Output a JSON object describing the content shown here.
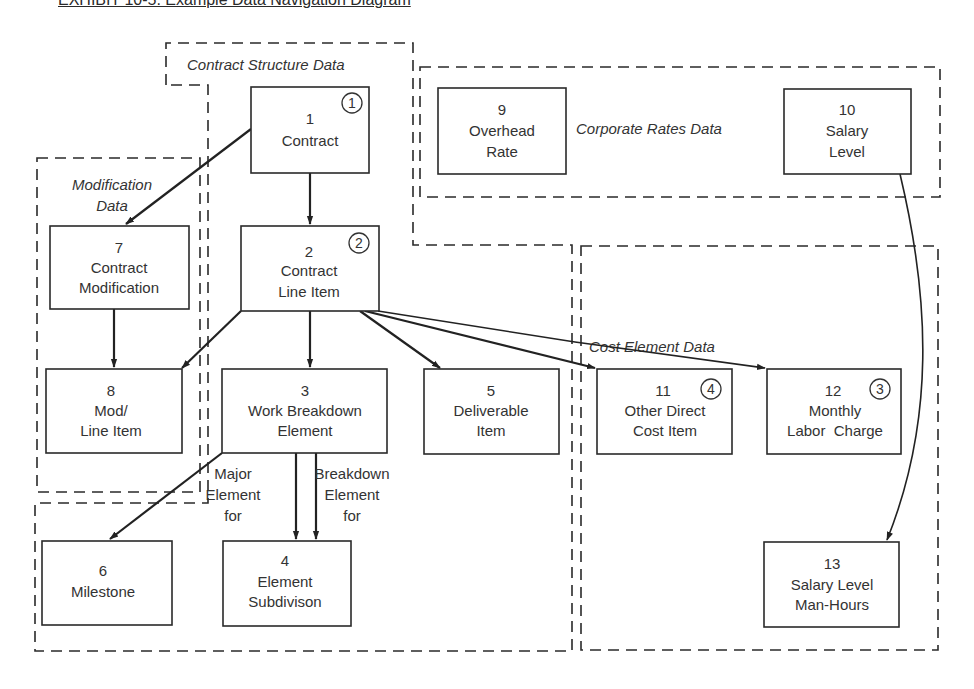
{
  "title": "EXHIBIT 10-5.  Example Data Navigation Diagram",
  "regions": {
    "contract_structure": "Contract Structure Data",
    "corporate_rates": "Corporate Rates Data",
    "modification": [
      "Modification",
      "Data"
    ],
    "cost_element": "Cost Element Data"
  },
  "entities": {
    "e1": {
      "num": "1",
      "lines": [
        "Contract"
      ],
      "step": "1"
    },
    "e2": {
      "num": "2",
      "lines": [
        "Contract",
        "Line Item"
      ],
      "step": "2"
    },
    "e3": {
      "num": "3",
      "lines": [
        "Work Breakdown",
        "Element"
      ]
    },
    "e4": {
      "num": "4",
      "lines": [
        "Element",
        "Subdivison"
      ]
    },
    "e5": {
      "num": "5",
      "lines": [
        "Deliverable",
        "Item"
      ]
    },
    "e6": {
      "num": "6",
      "lines": [
        "Milestone"
      ]
    },
    "e7": {
      "num": "7",
      "lines": [
        "Contract",
        "Modification"
      ]
    },
    "e8": {
      "num": "8",
      "lines": [
        "Mod/",
        "Line Item"
      ]
    },
    "e9": {
      "num": "9",
      "lines": [
        "Overhead",
        "Rate"
      ]
    },
    "e10": {
      "num": "10",
      "lines": [
        "Salary",
        "Level"
      ]
    },
    "e11": {
      "num": "11",
      "lines": [
        "Other Direct",
        "Cost Item"
      ],
      "step": "4"
    },
    "e12": {
      "num": "12",
      "lines": [
        "Monthly",
        "Labor  Charge"
      ],
      "step": "3"
    },
    "e13": {
      "num": "13",
      "lines": [
        "Salary Level",
        "Man-Hours"
      ]
    }
  },
  "relationships": {
    "major": [
      "Major",
      "Element",
      "for"
    ],
    "breakdown": [
      "Breakdown",
      "Element",
      "for"
    ]
  },
  "edges": [
    {
      "from": "1",
      "to": "2"
    },
    {
      "from": "1",
      "to": "7"
    },
    {
      "from": "7",
      "to": "8"
    },
    {
      "from": "2",
      "to": "8"
    },
    {
      "from": "2",
      "to": "3"
    },
    {
      "from": "2",
      "to": "5"
    },
    {
      "from": "2",
      "to": "11"
    },
    {
      "from": "2",
      "to": "12"
    },
    {
      "from": "3",
      "to": "6"
    },
    {
      "from": "3",
      "to": "4",
      "label": "Major Element for"
    },
    {
      "from": "3",
      "to": "4",
      "label": "Breakdown Element for"
    },
    {
      "from": "10",
      "to": "13"
    }
  ]
}
